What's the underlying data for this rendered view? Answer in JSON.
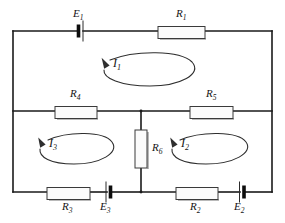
{
  "diagram": {
    "type": "electrical-circuit-schematic",
    "background_color": "#ffffff",
    "line_color": "#1a1a1a"
  },
  "components": {
    "resistors": [
      {
        "id": "R1",
        "label": "R",
        "sub": "1",
        "orientation": "horizontal",
        "branch": "top-rail"
      },
      {
        "id": "R2",
        "label": "R",
        "sub": "2",
        "orientation": "horizontal",
        "branch": "bottom-rail-right"
      },
      {
        "id": "R3",
        "label": "R",
        "sub": "3",
        "orientation": "horizontal",
        "branch": "bottom-rail-left"
      },
      {
        "id": "R4",
        "label": "R",
        "sub": "4",
        "orientation": "horizontal",
        "branch": "middle-rail-left"
      },
      {
        "id": "R5",
        "label": "R",
        "sub": "5",
        "orientation": "horizontal",
        "branch": "middle-rail-right"
      },
      {
        "id": "R6",
        "label": "R",
        "sub": "6",
        "orientation": "vertical",
        "branch": "center-bridge"
      }
    ],
    "batteries": [
      {
        "id": "E1",
        "label": "E",
        "sub": "1",
        "orientation": "horizontal",
        "branch": "top-rail",
        "polarity": "thick-bar-left"
      },
      {
        "id": "E2",
        "label": "E",
        "sub": "2",
        "orientation": "horizontal",
        "branch": "bottom-rail-right",
        "polarity": "thick-bar-right"
      },
      {
        "id": "E3",
        "label": "E",
        "sub": "3",
        "orientation": "horizontal",
        "branch": "bottom-rail-left",
        "polarity": "thick-bar-right"
      }
    ],
    "mesh_currents": [
      {
        "id": "I1",
        "label": "I",
        "sub": "1",
        "direction": "counterclockwise",
        "mesh": "upper"
      },
      {
        "id": "I2",
        "label": "I",
        "sub": "2",
        "direction": "counterclockwise",
        "mesh": "lower-right"
      },
      {
        "id": "I3",
        "label": "I",
        "sub": "3",
        "direction": "counterclockwise",
        "mesh": "lower-left"
      }
    ]
  }
}
